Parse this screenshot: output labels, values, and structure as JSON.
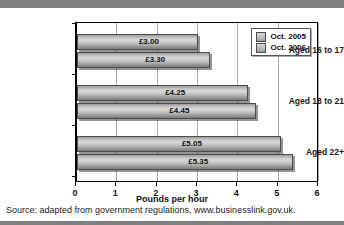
{
  "chart_data": {
    "type": "bar",
    "orientation": "horizontal",
    "title": "",
    "categories": [
      "Aged 16 to 17",
      "Aged 18 to 21",
      "Aged 22+"
    ],
    "series": [
      {
        "name": "Oct. 2005",
        "values": [
          3.0,
          4.25,
          5.05
        ],
        "labels": [
          "£3.00",
          "£4.25",
          "£5.05"
        ]
      },
      {
        "name": "Oct. 2006",
        "values": [
          3.3,
          4.45,
          5.35
        ],
        "labels": [
          "£3.30",
          "£4.45",
          "£5.35"
        ]
      }
    ],
    "xlabel": "Pounds per hour",
    "ylabel": "",
    "xlim": [
      0,
      6
    ],
    "xticks": [
      0,
      1,
      2,
      3,
      4,
      5,
      6
    ],
    "xticklabels": [
      "0",
      "1",
      "2",
      "3",
      "4",
      "5",
      "6"
    ],
    "grid": "vertical",
    "legend_position": "top-right",
    "colors": {
      "bar_light": "#d8d8d8",
      "bar_dark": "#7d7d7d",
      "bar_border": "#4d4d4d",
      "gridline": "#a9a9a9",
      "axis": "#000000",
      "band": "#808080"
    }
  },
  "legend": {
    "entries": [
      {
        "label": "Oct. 2005"
      },
      {
        "label": "Oct. 2006"
      }
    ]
  },
  "source": {
    "text": "Source: adapted from government regulations, www.businesslink.gov.uk."
  }
}
